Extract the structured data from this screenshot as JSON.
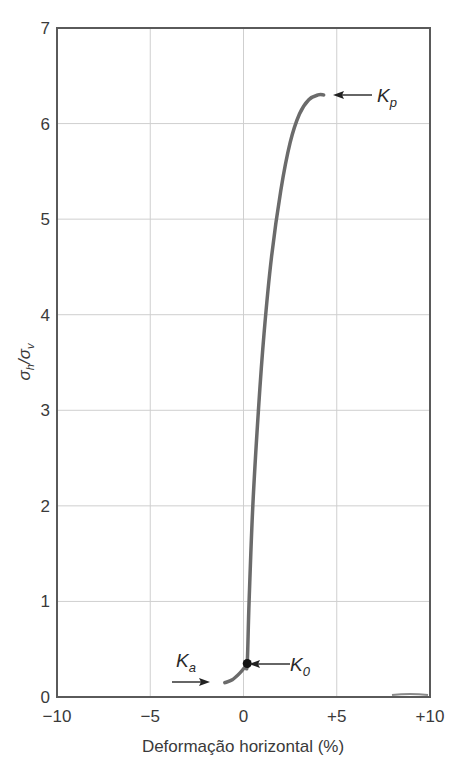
{
  "chart_data": {
    "type": "line",
    "title": "",
    "xlabel": "Deformação horizontal (%)",
    "ylabel": "σh/σv",
    "ylabel_parts": {
      "sigma_h": "σ",
      "h_sub": "h",
      "slash": "/",
      "sigma_v": "σ",
      "v_sub": "v"
    },
    "xlim": [
      -10,
      10
    ],
    "ylim": [
      0,
      7
    ],
    "grid": true,
    "x_ticks": [
      -10,
      -5,
      0,
      5,
      10
    ],
    "x_tick_labels": [
      "−10",
      "−5",
      "0",
      "+5",
      "+10"
    ],
    "y_ticks": [
      0,
      1,
      2,
      3,
      4,
      5,
      6,
      7
    ],
    "y_tick_labels": [
      "0",
      "1",
      "2",
      "3",
      "4",
      "5",
      "6",
      "7"
    ],
    "series": [
      {
        "name": "σh/σv vs deformação horizontal",
        "color": "#6b6b6b",
        "x": [
          -1.0,
          -0.6,
          -0.2,
          0.1,
          0.2,
          0.3,
          0.5,
          0.8,
          1.1,
          1.5,
          2.0,
          2.5,
          3.0,
          3.5,
          4.0,
          4.3
        ],
        "y": [
          0.15,
          0.18,
          0.25,
          0.32,
          0.35,
          1.0,
          2.0,
          3.0,
          3.8,
          4.6,
          5.3,
          5.8,
          6.1,
          6.25,
          6.3,
          6.3
        ]
      }
    ],
    "annotations": [
      {
        "label": "K",
        "sub": "p",
        "text": "Kp",
        "point": [
          4.3,
          6.3
        ],
        "arrow": "from right"
      },
      {
        "label": "K",
        "sub": "0",
        "text": "K0",
        "point": [
          0.2,
          0.35
        ],
        "arrow": "from right",
        "marker": "dot"
      },
      {
        "label": "K",
        "sub": "a",
        "text": "Ka",
        "point": [
          -1.4,
          0.15
        ],
        "arrow": "from left"
      }
    ]
  }
}
